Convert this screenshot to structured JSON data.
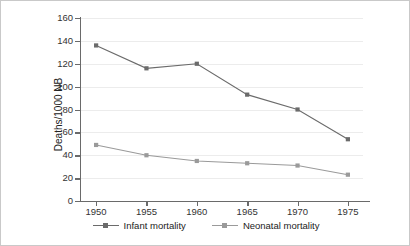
{
  "figure": {
    "border_color": "#c9c9c9",
    "background": "#ffffff"
  },
  "axis": {
    "ylabel": "Deaths/1000 NB",
    "yticks": [
      "160",
      "140",
      "120",
      "100",
      "80",
      "60",
      "40",
      "20",
      "0"
    ],
    "xticks": [
      "1950",
      "1955",
      "1960",
      "1965",
      "1970",
      "1975"
    ]
  },
  "legend": {
    "items": [
      {
        "label": "Infant mortality",
        "color": "#6b6b6b"
      },
      {
        "label": "Neonatal mortality",
        "color": "#9a9a9a"
      }
    ]
  },
  "chart_data": {
    "type": "line",
    "title": "",
    "xlabel": "",
    "ylabel": "Deaths/1000 NB",
    "x": [
      1950,
      1955,
      1960,
      1965,
      1970,
      1975
    ],
    "categories": [
      "1950",
      "1955",
      "1960",
      "1965",
      "1970",
      "1975"
    ],
    "series": [
      {
        "name": "Infant mortality",
        "color": "#6b6b6b",
        "marker": "square",
        "values": [
          136,
          116,
          120,
          93,
          80,
          54
        ]
      },
      {
        "name": "Neonatal mortality",
        "color": "#9a9a9a",
        "marker": "square",
        "values": [
          49,
          40,
          35,
          33,
          31,
          23
        ]
      }
    ],
    "xlim": [
      1948.5,
      1976.5
    ],
    "ylim": [
      0,
      160
    ],
    "ytick_step": 20,
    "grid": true,
    "grid_axis": "y",
    "legend_position": "bottom"
  }
}
